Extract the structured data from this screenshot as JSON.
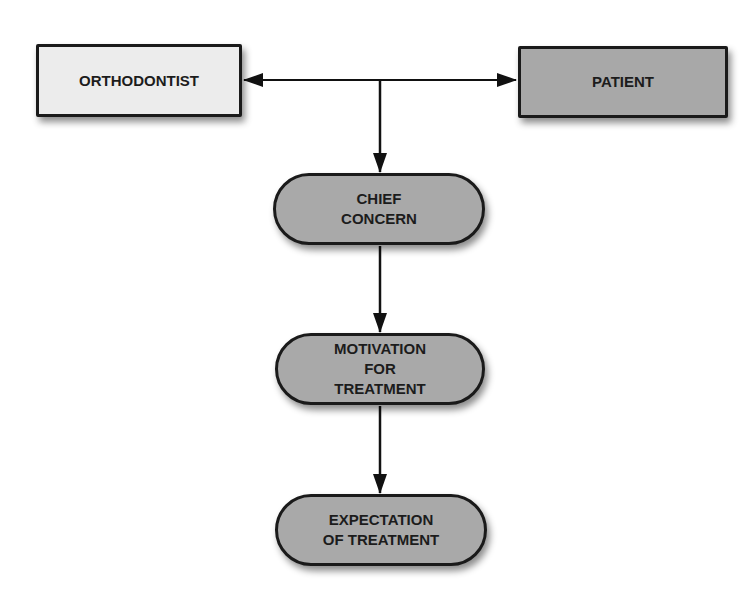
{
  "diagram": {
    "nodes": {
      "orthodontist": {
        "label": "ORTHODONTIST",
        "shape": "rectangle",
        "fill": "#ececec"
      },
      "patient": {
        "label": "PATIENT",
        "shape": "rectangle",
        "fill": "#a8a8a8"
      },
      "chief_concern": {
        "label": "CHIEF\nCONCERN",
        "shape": "pill",
        "fill": "#a9a9a9"
      },
      "motivation": {
        "label": "MOTIVATION\nFOR\nTREATMENT",
        "shape": "pill",
        "fill": "#a9a9a9"
      },
      "expectation": {
        "label": "EXPECTATION\nOF TREATMENT",
        "shape": "pill",
        "fill": "#a9a9a9"
      }
    },
    "edges": [
      {
        "from": "junction",
        "to": "orthodontist",
        "type": "arrow"
      },
      {
        "from": "junction",
        "to": "patient",
        "type": "arrow"
      },
      {
        "from": "junction",
        "to": "chief_concern",
        "type": "arrow"
      },
      {
        "from": "chief_concern",
        "to": "motivation",
        "type": "arrow"
      },
      {
        "from": "motivation",
        "to": "expectation",
        "type": "arrow"
      }
    ]
  }
}
